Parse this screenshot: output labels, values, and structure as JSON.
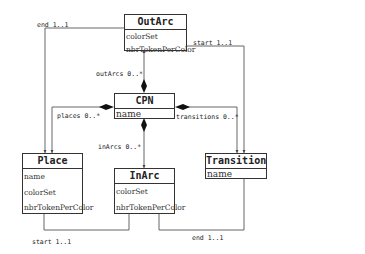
{
  "classes": {
    "outarc": {
      "name": "OutArc",
      "attributes": [
        "colorSet",
        "nbrTokenPerColor"
      ]
    },
    "cpn": {
      "name": "CPN",
      "attributes": [
        "name"
      ]
    },
    "place": {
      "name": "Place",
      "attributes": [
        "name",
        "colorSet",
        "nbrTokenPerColor"
      ]
    },
    "inarc": {
      "name": "InArc",
      "attributes": [
        "colorSet",
        "nbrTokenPerColor"
      ]
    },
    "transition": {
      "name": "Transition",
      "attributes": [
        "name"
      ]
    }
  },
  "associations": {
    "outarc_end": "end 1..1",
    "outarc_start": "start 1..1",
    "outarcs": "outArcs 0..*",
    "places": "places 0..*",
    "transitions": "transitions 0..*",
    "inarcs": "inArcs 0..*",
    "inarc_start": "start 1..1",
    "inarc_end": "end 1..1"
  },
  "colors": {
    "line": "#555555",
    "border": "#333333"
  }
}
